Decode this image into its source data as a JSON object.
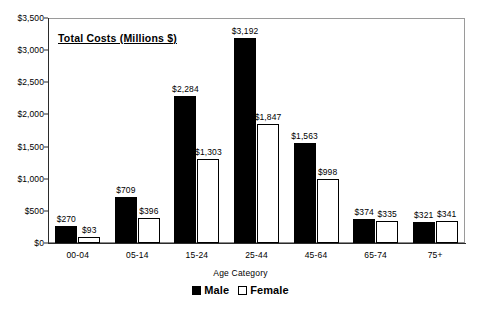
{
  "chart_data": {
    "type": "bar",
    "title": "Total Costs (Millions $)",
    "xlabel": "Age Category",
    "ylabel": "",
    "categories": [
      "00-04",
      "05-14",
      "15-24",
      "25-44",
      "45-64",
      "65-74",
      "75+"
    ],
    "series": [
      {
        "name": "Male",
        "values": [
          270,
          709,
          2284,
          3192,
          1563,
          374,
          321
        ],
        "labels": [
          "$270",
          "$709",
          "$2,284",
          "$3,192",
          "$1,563",
          "$374",
          "$321"
        ],
        "color": "#000000",
        "fill": "solid-black"
      },
      {
        "name": "Female",
        "values": [
          93,
          396,
          1303,
          1847,
          998,
          335,
          341
        ],
        "labels": [
          "$93",
          "$396",
          "$1,303",
          "$1,847",
          "$998",
          "$335",
          "$341"
        ],
        "color": "#ffffff",
        "fill": "dotted-stipple-black-outline"
      }
    ],
    "ylim": [
      0,
      3500
    ],
    "yticks": [
      0,
      500,
      1000,
      1500,
      2000,
      2500,
      3000,
      3500
    ],
    "ytick_labels": [
      "$0",
      "$500",
      "$1,000",
      "$1,500",
      "$2,000",
      "$2,500",
      "$3,000",
      "$3,500"
    ],
    "grid": false,
    "legend_position": "bottom-center",
    "legend_entries": [
      "Male",
      "Female"
    ],
    "background_color": "#ffffff",
    "frame_color": "#8a8a8a"
  },
  "legend": {
    "male_label": "Male",
    "female_label": "Female"
  }
}
